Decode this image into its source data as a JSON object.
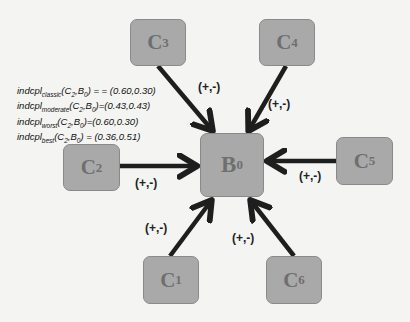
{
  "diagram": {
    "center_node": {
      "id": "B0",
      "base": "B",
      "sub": "0"
    },
    "nodes": [
      {
        "id": "C3",
        "base": "C",
        "sub": "3",
        "x": 130,
        "y": 19,
        "w": 56,
        "h": 47
      },
      {
        "id": "C4",
        "base": "C",
        "sub": "4",
        "x": 259,
        "y": 19,
        "w": 56,
        "h": 47
      },
      {
        "id": "C2",
        "base": "C",
        "sub": "2",
        "x": 63,
        "y": 144,
        "w": 57,
        "h": 47
      },
      {
        "id": "C5",
        "base": "C",
        "sub": "5",
        "x": 336,
        "y": 137,
        "w": 57,
        "h": 48
      },
      {
        "id": "C1",
        "base": "C",
        "sub": "1",
        "x": 143,
        "y": 256,
        "w": 56,
        "h": 48
      },
      {
        "id": "C6",
        "base": "C",
        "sub": "6",
        "x": 266,
        "y": 256,
        "w": 56,
        "h": 48
      }
    ],
    "edge_labels": {
      "C3": "(+,-)",
      "C4": "(+,-)",
      "C2": "(+,-)",
      "C5": "(+,-)",
      "C1": "(+,-)",
      "C6": "(+,-)"
    },
    "formulas": [
      {
        "fn": "indcpl",
        "sub": "classic",
        "args_a": "C",
        "args_a_sub": "2",
        "args_b": "B",
        "args_b_sub": "0",
        "value": "= = (0.60,0.30)"
      },
      {
        "fn": "indcpl",
        "sub": "moderate",
        "args_a": "C",
        "args_a_sub": "2",
        "args_b": "B",
        "args_b_sub": "0",
        "value": "=(0.43,0.43)"
      },
      {
        "fn": "indcpl",
        "sub": "worst",
        "args_a": "C",
        "args_a_sub": "2",
        "args_b": "B",
        "args_b_sub": "0",
        "value": "=(0.60,0.30)"
      },
      {
        "fn": "indcpl",
        "sub": "best",
        "args_a": "C",
        "args_a_sub": "2",
        "args_b": "B",
        "args_b_sub": "0",
        "value": "= (0.36,0.51)"
      }
    ],
    "colors": {
      "node_fill": "#a9a9a9",
      "node_border": "#8a8a8a",
      "node_text": "#6f6f6f",
      "arrow": "#1e1e1e",
      "background": "#f4f4f2"
    }
  }
}
